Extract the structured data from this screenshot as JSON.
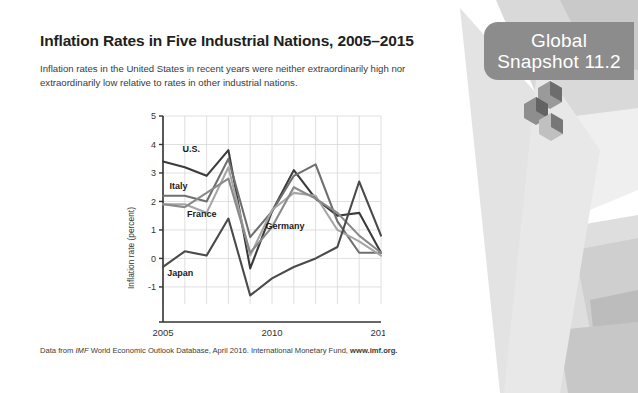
{
  "slide": {
    "title": "Inflation Rates in Five Industrial Nations, 2005–2015",
    "subtitle": "Inflation rates in the United States in recent years were neither extraordinarily high nor extraordinarily low relative to rates in other industrial nations.",
    "badge_line1": "Global",
    "badge_line2": "Snapshot 11.2",
    "badge_color": "#8c8c8c",
    "footer": {
      "prefix": "Data from ",
      "italic": "IMF",
      "middle": " World Economic Outlook Database, April 2016. International Monetary Fund, ",
      "bold": "www.imf.org."
    }
  },
  "chart_data": {
    "type": "line",
    "title": "Inflation Rates in Five Industrial Nations, 2005–2015",
    "xlabel": "",
    "ylabel": "Inflation rate (percent)",
    "x": [
      2005,
      2006,
      2007,
      2008,
      2009,
      2010,
      2011,
      2012,
      2013,
      2014,
      2015
    ],
    "xlim": [
      2005,
      2015
    ],
    "ylim": [
      -1.6,
      5
    ],
    "xticks": [
      2005,
      2010,
      2015
    ],
    "yticks": [
      -1,
      0,
      1,
      2,
      3,
      4,
      5
    ],
    "grid": true,
    "legend": "inline-labels",
    "series": [
      {
        "name": "U.S.",
        "color": "#3b3b3b",
        "label_x": 2005.9,
        "label_y": 3.72,
        "values": [
          3.4,
          3.2,
          2.9,
          3.8,
          -0.35,
          1.65,
          3.1,
          2.1,
          1.5,
          1.6,
          0.2
        ]
      },
      {
        "name": "Italy",
        "color": "#6f6f6f",
        "label_x": 2005.3,
        "label_y": 2.45,
        "values": [
          2.2,
          2.2,
          2.0,
          3.5,
          0.75,
          1.65,
          2.9,
          3.3,
          1.3,
          0.2,
          0.2
        ]
      },
      {
        "name": "France",
        "color": "#a6a6a6",
        "label_x": 2006.1,
        "label_y": 1.45,
        "values": [
          1.9,
          1.9,
          1.6,
          3.2,
          0.1,
          1.7,
          2.3,
          2.2,
          1.0,
          0.6,
          0.1
        ]
      },
      {
        "name": "Germany",
        "color": "#8a8a8a",
        "label_x": 2009.7,
        "label_y": 1.05,
        "values": [
          1.9,
          1.8,
          2.3,
          2.8,
          0.2,
          1.1,
          2.5,
          2.1,
          1.6,
          0.8,
          0.2
        ]
      },
      {
        "name": "Japan",
        "color": "#4a4a4a",
        "label_x": 2005.2,
        "label_y": -0.62,
        "values": [
          -0.3,
          0.25,
          0.1,
          1.4,
          -1.3,
          -0.7,
          -0.3,
          0.0,
          0.4,
          2.7,
          0.8
        ]
      }
    ]
  }
}
